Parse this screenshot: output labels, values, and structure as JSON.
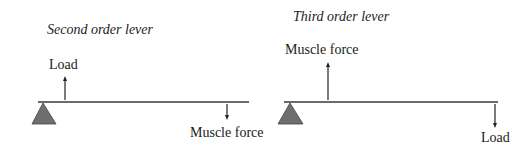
{
  "colors": {
    "beam": "#3a3a3a",
    "fulcrum": "#6e6e6e",
    "text": "#1a1a1a"
  },
  "diagrams": [
    {
      "title": "Second order lever",
      "labels": {
        "up_arrow": "Load",
        "down_arrow": "Muscle force"
      },
      "icons": {
        "fulcrum": "triangle-fulcrum-icon",
        "up": "arrow-up-icon",
        "down": "arrow-down-icon"
      }
    },
    {
      "title": "Third order lever",
      "labels": {
        "up_arrow": "Muscle force",
        "down_arrow": "Load"
      },
      "icons": {
        "fulcrum": "triangle-fulcrum-icon",
        "up": "arrow-up-icon",
        "down": "arrow-down-icon"
      }
    }
  ]
}
